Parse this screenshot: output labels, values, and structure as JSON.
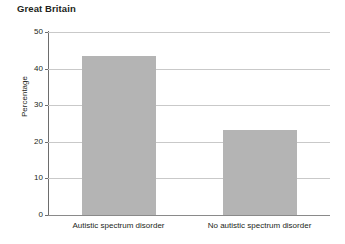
{
  "chart_data": {
    "type": "bar",
    "title": "Great Britain",
    "xlabel": "",
    "ylabel": "Percentage",
    "categories": [
      "Autistic spectrum disorder",
      "No autistic spectrum disorder"
    ],
    "values": [
      43.4,
      23.2
    ],
    "ylim": [
      0,
      50
    ],
    "ytick_labels": [
      "0",
      "10",
      "20",
      "30",
      "40",
      "50"
    ],
    "ytick_values": [
      0,
      10,
      20,
      30,
      40,
      50
    ],
    "grid": "horizontal",
    "legend": "none",
    "bar_color": "#b4b4b4",
    "gridline_color": "#c9c9c9",
    "axis_color": "#6d6d6d",
    "text_color": "#231f20",
    "background_color": "#ffffff"
  }
}
